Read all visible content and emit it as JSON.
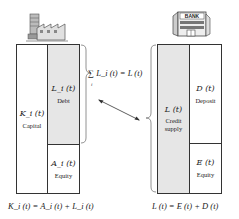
{
  "firm": {
    "icon": "factory-icon",
    "capital": {
      "symbol": "K_i (t)",
      "label": "Capital"
    },
    "debt": {
      "symbol": "L_i (t)",
      "label": "Debt"
    },
    "equity": {
      "symbol": "A_i (t)",
      "label": "Equity"
    },
    "identity": "K_i (t) = A_i (t) + L_i (t)"
  },
  "bank": {
    "icon": "bank-icon",
    "icon_text": "BANK",
    "credit": {
      "symbol": "L (t)",
      "label_line1": "Credit",
      "label_line2": "supply"
    },
    "deposit": {
      "symbol": "D (t)",
      "label": "Deposit"
    },
    "equity": {
      "symbol": "E (t)",
      "label": "Equity"
    },
    "identity": "L (t) = E (t) + D (t)"
  },
  "link": {
    "aggregation": "∑ L_i (t) = L (t)",
    "sum_index": "i",
    "arrow": "double-headed"
  },
  "colors": {
    "shade": "#e6e6e6",
    "line": "#333333"
  }
}
